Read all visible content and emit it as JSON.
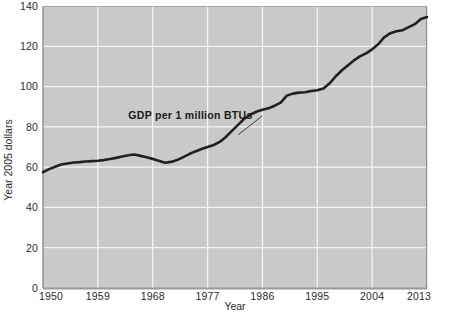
{
  "chart_data": {
    "type": "line",
    "title": "",
    "xlabel": "Year",
    "ylabel": "Year 2005 dollars",
    "xlim": [
      1950,
      2013
    ],
    "ylim": [
      0,
      140
    ],
    "grid": true,
    "legend": "none",
    "xticks": [
      "1950",
      "1959",
      "1968",
      "1977",
      "1986",
      "1995",
      "2004",
      "2013"
    ],
    "yticks": [
      "0",
      "20",
      "40",
      "60",
      "80",
      "100",
      "120",
      "140"
    ],
    "annotations": [
      {
        "text": "GDP per 1 million BTUs",
        "x": 1964,
        "y": 84,
        "leader_to_x": 1982,
        "leader_to_y": 76
      }
    ],
    "series": [
      {
        "name": "GDP per 1 million BTUs",
        "color": "#231f20",
        "x": [
          1950,
          1951,
          1952,
          1953,
          1954,
          1955,
          1956,
          1957,
          1958,
          1959,
          1960,
          1961,
          1962,
          1963,
          1964,
          1965,
          1966,
          1967,
          1968,
          1969,
          1970,
          1971,
          1972,
          1973,
          1974,
          1975,
          1976,
          1977,
          1978,
          1979,
          1980,
          1981,
          1982,
          1983,
          1984,
          1985,
          1986,
          1987,
          1988,
          1989,
          1990,
          1991,
          1992,
          1993,
          1994,
          1995,
          1996,
          1997,
          1998,
          1999,
          2000,
          2001,
          2002,
          2003,
          2004,
          2005,
          2006,
          2007,
          2008,
          2009,
          2010,
          2011,
          2012,
          2013
        ],
        "values": [
          57.5,
          59.0,
          60.2,
          61.3,
          61.8,
          62.3,
          62.5,
          62.8,
          63.0,
          63.2,
          63.5,
          64.0,
          64.6,
          65.3,
          65.9,
          66.3,
          65.6,
          64.9,
          64.1,
          63.2,
          62.2,
          62.6,
          63.5,
          65.0,
          66.5,
          67.8,
          69.0,
          70.0,
          71.0,
          72.5,
          75.0,
          78.0,
          81.0,
          84.0,
          86.0,
          87.5,
          88.5,
          89.2,
          90.5,
          92.0,
          95.5,
          96.5,
          97.0,
          97.2,
          97.8,
          98.2,
          99.0,
          101.5,
          105.0,
          108.0,
          110.5,
          113.0,
          115.0,
          116.5,
          118.5,
          121.0,
          124.5,
          126.5,
          127.5,
          128.0,
          129.5,
          131.0,
          133.5,
          134.5
        ]
      }
    ]
  },
  "theme": {
    "plot_background": "#c9c9c9",
    "grid_color": "#f4f4f4",
    "line_color": "#231f20",
    "text_color": "#2b2b2b",
    "page_background": "#ffffff"
  },
  "caption": {
    "text": ""
  }
}
